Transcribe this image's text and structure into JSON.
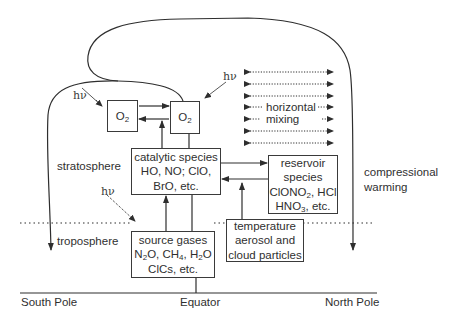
{
  "diagram": {
    "region_labels": {
      "stratosphere": "stratosphere",
      "troposphere": "troposphere",
      "compressional_warming_line1": "compressional",
      "compressional_warming_line2": "warming"
    },
    "axis": {
      "left": "South Pole",
      "center": "Equator",
      "right": "North Pole"
    },
    "photon_label": "hν",
    "boxes": {
      "o2_left": {
        "main": "O",
        "sub": "2"
      },
      "o2_right": {
        "main": "O",
        "sub": "2"
      },
      "catalytic": {
        "line1": "catalytic species",
        "line2": "HO, NO; ClO,",
        "line3": "BrO, etc."
      },
      "reservoir": {
        "line1": "reservoir",
        "line2": "species",
        "line3_a": "ClONO",
        "line3_sub": "2",
        "line3_b": ", HCl",
        "line4_a": "HNO",
        "line4_sub": "3",
        "line4_b": ", etc."
      },
      "source_gases": {
        "line1": "source gases",
        "line2_a": "N",
        "line2_sub1": "2",
        "line2_b": "O, CH",
        "line2_sub2": "4",
        "line2_c": ", H",
        "line2_sub3": "2",
        "line2_d": "O",
        "line3": "ClCs, etc."
      },
      "temperature": {
        "line1": "temperature",
        "line2": "aerosol and",
        "line3": "cloud particles"
      }
    },
    "horizontal_mixing": {
      "line1": "horizontal",
      "line2": "mixing",
      "arrow_count": 7
    },
    "colors": {
      "line": "#2e2e2e",
      "text": "#2f2f2f",
      "background": "#ffffff"
    }
  }
}
